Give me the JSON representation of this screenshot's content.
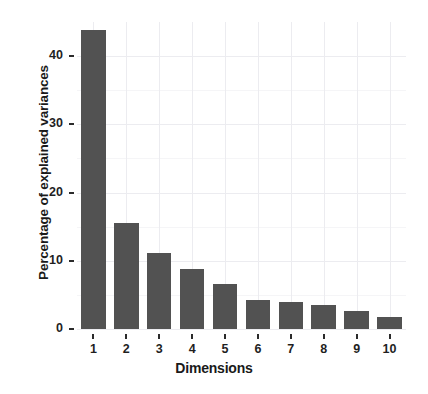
{
  "chart_data": {
    "type": "bar",
    "title": "",
    "subtitle": "",
    "xlabel": "Dimensions",
    "ylabel": "Percentage of explained variances",
    "categories": [
      "1",
      "2",
      "3",
      "4",
      "5",
      "6",
      "7",
      "8",
      "9",
      "10"
    ],
    "values": [
      43.9,
      15.6,
      11.2,
      8.8,
      6.6,
      4.2,
      3.9,
      3.5,
      2.6,
      1.8
    ],
    "series": [
      {
        "name": "Percentage of explained variances",
        "values": [
          43.9,
          15.6,
          11.2,
          8.8,
          6.6,
          4.2,
          3.9,
          3.5,
          2.6,
          1.8
        ]
      }
    ],
    "ylim": [
      0,
      45
    ],
    "xlim": [
      0.5,
      10.5
    ],
    "y_ticks": [
      0,
      10,
      20,
      30,
      40
    ],
    "y_tick_labels": [
      "0",
      "10",
      "20",
      "30",
      "40"
    ],
    "x_tick_labels": [
      "1",
      "2",
      "3",
      "4",
      "5",
      "6",
      "7",
      "8",
      "9",
      "10"
    ],
    "grid": true,
    "grid_major": true,
    "grid_minor": true,
    "legend": false,
    "legend_position": "none",
    "bar_color": "#525252",
    "grid_color": "#ececf0",
    "background_color": "#ffffff",
    "axis_text_color": "#1f1f1f"
  }
}
